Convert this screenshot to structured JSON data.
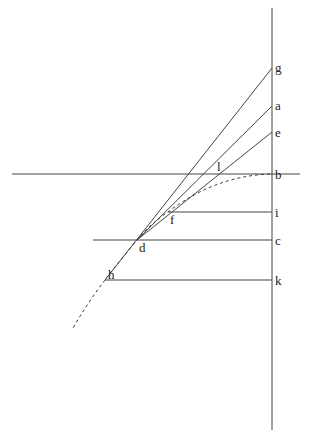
{
  "diagram": {
    "type": "geometric construction",
    "points": {
      "g": {
        "label": "g",
        "x": 272,
        "y": 68
      },
      "a": {
        "label": "a",
        "x": 272,
        "y": 106
      },
      "e": {
        "label": "e",
        "x": 272,
        "y": 132
      },
      "b": {
        "label": "b",
        "x": 272,
        "y": 174
      },
      "i": {
        "label": "i",
        "x": 272,
        "y": 212
      },
      "c": {
        "label": "c",
        "x": 272,
        "y": 240
      },
      "k": {
        "label": "k",
        "x": 272,
        "y": 280
      },
      "l": {
        "label": "l",
        "x": 221,
        "y": 174
      },
      "f": {
        "label": "f",
        "x": 168,
        "y": 212
      },
      "d": {
        "label": "d",
        "x": 137,
        "y": 240
      },
      "h": {
        "label": "h",
        "x": 105,
        "y": 280
      }
    },
    "labels": {
      "g": "g",
      "a": "a",
      "e": "e",
      "b": "b",
      "i": "i",
      "c": "c",
      "k": "k",
      "l": "l",
      "f": "f",
      "d": "d",
      "h": "h"
    }
  }
}
